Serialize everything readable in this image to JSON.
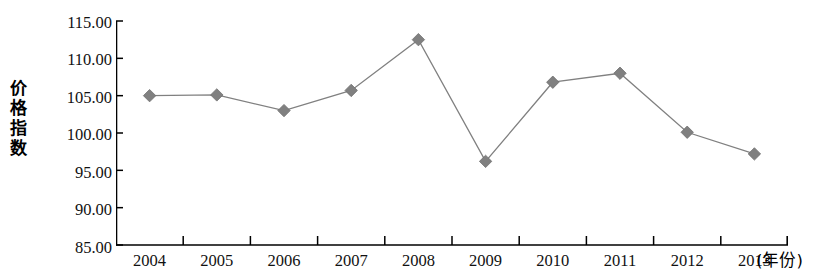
{
  "chart_data": {
    "type": "line",
    "title": "",
    "subtitle": "",
    "xlabel": "(年份)",
    "ylabel": "价格指数",
    "ylabel_chars": [
      "价",
      "格",
      "指",
      "数"
    ],
    "categories": [
      "2004",
      "2005",
      "2006",
      "2007",
      "2008",
      "2009",
      "2010",
      "2011",
      "2012",
      "2013"
    ],
    "values": [
      105.0,
      105.1,
      103.0,
      105.7,
      112.5,
      96.2,
      106.8,
      108.0,
      100.1,
      97.2
    ],
    "series": [
      {
        "name": "价格指数",
        "values": [
          105.0,
          105.1,
          103.0,
          105.7,
          112.5,
          96.2,
          106.8,
          108.0,
          100.1,
          97.2
        ]
      }
    ],
    "ylim": [
      85.0,
      115.0
    ],
    "ytick_step": 5.0,
    "ytick_labels": [
      "115.00",
      "110.00",
      "105.00",
      "100.00",
      "95.00",
      "90.00",
      "85.00"
    ],
    "ytick_values": [
      115.0,
      110.0,
      105.0,
      100.0,
      95.0,
      90.0,
      85.0
    ],
    "grid": false,
    "legend": false,
    "legend_position": "none",
    "marker": "diamond",
    "marker_color": "#808080",
    "line_color": "#808080",
    "axis_color": "#000000"
  }
}
